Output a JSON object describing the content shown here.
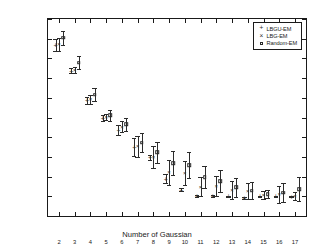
{
  "chart_data": {
    "type": "scatter",
    "title": "",
    "xlabel": "Number of Gaussian",
    "ylabel": "-log likelihood",
    "xlim": [
      1.3,
      17.7
    ],
    "ylim": [
      -900,
      100
    ],
    "ytick_labels": [
      "100",
      "0",
      "-100",
      "-200",
      "-300",
      "-400",
      "-500",
      "-600",
      "-700",
      "-800",
      "-900"
    ],
    "ytick_values": [
      100,
      0,
      -100,
      -200,
      -300,
      -400,
      -500,
      -600,
      -700,
      -800,
      -900
    ],
    "xtick_labels": [
      "2",
      "3",
      "4",
      "5",
      "6",
      "7",
      "8",
      "9",
      "10",
      "11",
      "12",
      "13",
      "14",
      "15",
      "16",
      "17"
    ],
    "xtick_values": [
      2,
      3,
      4,
      5,
      6,
      7,
      8,
      9,
      10,
      11,
      12,
      13,
      14,
      15,
      16,
      17
    ],
    "grid": false,
    "legend_position": "upper right",
    "error_bars": "vertical",
    "categories": [
      2,
      3,
      4,
      5,
      6,
      7,
      8,
      9,
      10,
      11,
      12,
      13,
      14,
      15,
      16,
      17
    ],
    "series": [
      {
        "name": "LBGU-EM",
        "marker": "plus",
        "x_offset": -0.22,
        "values": [
          -32,
          -162,
          -313,
          -403,
          -463,
          -549,
          -601,
          -711,
          -766,
          -797,
          -800,
          -801,
          -807,
          -801,
          -801,
          -802
        ],
        "err_up": [
          30,
          14,
          18,
          14,
          24,
          47,
          13,
          22,
          8,
          6,
          6,
          5,
          5,
          4,
          4,
          4
        ],
        "err_down": [
          30,
          14,
          18,
          14,
          24,
          47,
          13,
          22,
          8,
          6,
          6,
          5,
          5,
          4,
          4,
          4
        ]
      },
      {
        "name": "LBG-EM",
        "marker": "cross",
        "x_offset": 0.0,
        "values": [
          -28,
          -160,
          -307,
          -398,
          -447,
          -546,
          -600,
          -679,
          -682,
          -751,
          -747,
          -766,
          -773,
          -793,
          -790,
          -798
        ],
        "err_up": [
          32,
          16,
          22,
          17,
          29,
          54,
          55,
          62,
          62,
          49,
          52,
          46,
          42,
          20,
          44,
          22
        ],
        "err_down": [
          32,
          16,
          22,
          17,
          29,
          54,
          55,
          62,
          62,
          49,
          52,
          46,
          42,
          20,
          44,
          22
        ]
      },
      {
        "name": "Random-EM",
        "marker": "square",
        "x_offset": 0.26,
        "values": [
          5,
          -122,
          -285,
          -388,
          -433,
          -527,
          -576,
          -632,
          -641,
          -704,
          -722,
          -755,
          -771,
          -788,
          -781,
          -763
        ],
        "err_up": [
          36,
          32,
          33,
          28,
          33,
          48,
          54,
          60,
          64,
          56,
          56,
          47,
          44,
          22,
          46,
          62
        ],
        "err_down": [
          36,
          32,
          33,
          28,
          33,
          48,
          54,
          60,
          64,
          56,
          56,
          47,
          44,
          22,
          46,
          62
        ]
      }
    ]
  },
  "legend": {
    "entries": [
      {
        "label": "LBGU-EM",
        "symbol": "+"
      },
      {
        "label": "LBG-EM",
        "symbol": "×"
      },
      {
        "label": "Random-EM",
        "symbol": "square"
      }
    ]
  }
}
